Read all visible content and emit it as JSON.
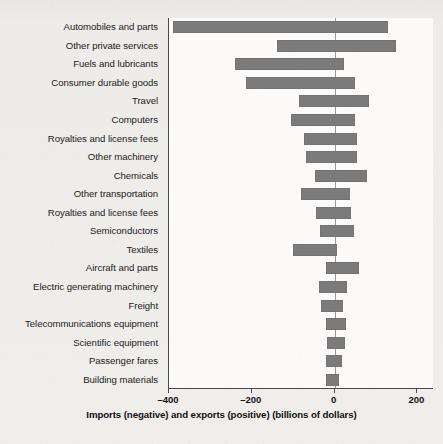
{
  "chart_data": {
    "type": "bar",
    "orientation": "horizontal",
    "title": "",
    "subtitle": "",
    "xlabel": "Imports (negative) and exports (positive) (billions of dollars)",
    "ylabel": "",
    "xlim": [
      -400,
      240
    ],
    "xticks": [
      -400,
      -200,
      0,
      200
    ],
    "xticklabels": [
      "–400",
      "–200",
      "0",
      "200"
    ],
    "grid": false,
    "legend": null,
    "bar_color": "#7b7b7b",
    "zero_line": true,
    "categories": [
      "Automobiles and parts",
      "Other private services",
      "Fuels and lubricants",
      "Consumer durable goods",
      "Travel",
      "Computers",
      "Royalties and license fees",
      "Other machinery",
      "Chemicals",
      "Other transportation",
      "Royalties and license fees",
      "Semiconductors",
      "Textiles",
      "Aircraft and parts",
      "Electric generating machinery",
      "Freight",
      "Telecommunications equipment",
      "Scientific equipment",
      "Passenger fares",
      "Building materials"
    ],
    "bars": [
      {
        "category": "Automobiles and parts",
        "import": -390,
        "export": 130
      },
      {
        "category": "Other private services",
        "import": -140,
        "export": 148
      },
      {
        "category": "Fuels and lubricants",
        "import": -240,
        "export": 22
      },
      {
        "category": "Consumer durable goods",
        "import": -215,
        "export": 50
      },
      {
        "category": "Travel",
        "import": -85,
        "export": 82
      },
      {
        "category": "Computers",
        "import": -105,
        "export": 50
      },
      {
        "category": "Royalties and license fees",
        "import": -75,
        "export": 55
      },
      {
        "category": "Other machinery",
        "import": -68,
        "export": 53
      },
      {
        "category": "Chemicals",
        "import": -48,
        "export": 78
      },
      {
        "category": "Other transportation",
        "import": -82,
        "export": 38
      },
      {
        "category": "Royalties and license fees",
        "import": -45,
        "export": 40
      },
      {
        "category": "Semiconductors",
        "import": -35,
        "export": 48
      },
      {
        "category": "Textiles",
        "import": -100,
        "export": 5
      },
      {
        "category": "Aircraft and parts",
        "import": -22,
        "export": 58
      },
      {
        "category": "Electric generating machinery",
        "import": -38,
        "export": 30
      },
      {
        "category": "Freight",
        "import": -32,
        "export": 20
      },
      {
        "category": "Telecommunications equipment",
        "import": -20,
        "export": 28
      },
      {
        "category": "Scientific equipment",
        "import": -18,
        "export": 25
      },
      {
        "category": "Passenger fares",
        "import": -20,
        "export": 18
      },
      {
        "category": "Building materials",
        "import": -20,
        "export": 10
      }
    ]
  }
}
